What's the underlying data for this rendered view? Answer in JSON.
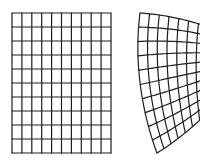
{
  "figure": {
    "stroke_color": "#1e1e1e",
    "background": "#ffffff"
  },
  "left_grid": {
    "x0": 12,
    "y0": 13,
    "x1": 111,
    "y1": 153,
    "columns": 10,
    "rows": 10
  },
  "right_grid": {
    "columns": 10,
    "rows": 10,
    "clip_right": 200,
    "top_curve": [
      [
        140,
        13
      ],
      [
        172,
        15
      ],
      [
        205,
        24
      ],
      [
        238,
        38
      ]
    ],
    "bottom_curve": [
      [
        157,
        153
      ],
      [
        180,
        139
      ],
      [
        205,
        117
      ],
      [
        228,
        92
      ]
    ],
    "left_curve": [
      [
        140,
        13
      ],
      [
        134,
        60
      ],
      [
        141,
        110
      ],
      [
        157,
        153
      ]
    ],
    "right_curve": [
      [
        238,
        38
      ],
      [
        236,
        55
      ],
      [
        232,
        74
      ],
      [
        228,
        92
      ]
    ]
  }
}
